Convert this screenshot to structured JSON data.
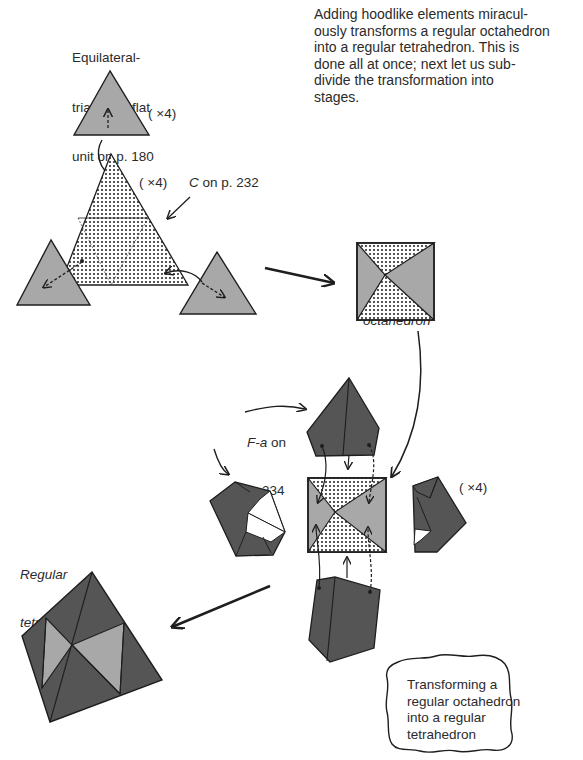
{
  "intro_paragraph": {
    "lines": [
      "Adding hoodlike elements miracul-",
      "ously transforms a regular octahedron",
      "into a regular tetrahedron. This is",
      "done all at once; next let us sub-",
      "divide the transformation into",
      "stages."
    ]
  },
  "labels": {
    "flat_unit": [
      "Equilateral-",
      "triangular flat",
      "unit on p. 180"
    ],
    "times4_top": "( ×4)",
    "times4_mid": "( ×4)",
    "times4_right": "( ×4)",
    "c_ref_letter": "C",
    "c_ref_rest": " on p. 232",
    "octahedron": [
      "Regular",
      "octahedron"
    ],
    "fa_ref_letter": "F-a",
    "fa_ref_rest": " on",
    "fa_ref_page": "p. 234",
    "tetrahedron": [
      "Regular",
      "tetrahedron"
    ]
  },
  "caption_cloud": {
    "lines": [
      "Transforming a",
      "regular octahedron",
      "into a regular",
      "tetrahedron"
    ]
  },
  "colors": {
    "light_gray_unit": "#a8a8a8",
    "dark_gray_hood": "#555555",
    "outline": "#1e1e1e",
    "dot_pattern": "#2a2a2a"
  }
}
